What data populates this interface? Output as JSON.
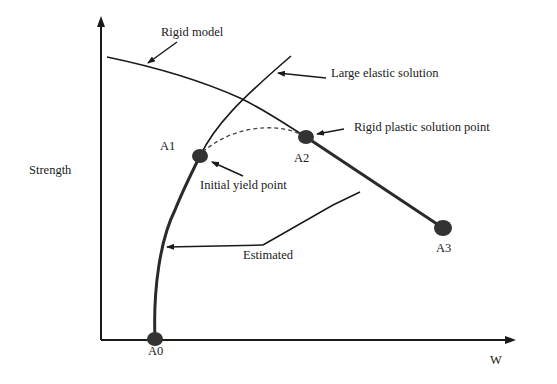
{
  "diagram": {
    "axes": {
      "y_label": "Strength",
      "x_label": "W"
    },
    "curves": {
      "rigid_model": {
        "label": "Rigid model"
      },
      "large_elastic": {
        "label": "Large elastic solution"
      },
      "estimated": {
        "label": "Estimated"
      }
    },
    "points": [
      {
        "id": "A0",
        "label": "A0"
      },
      {
        "id": "A1",
        "label": "A1",
        "annotation": "Initial yield point"
      },
      {
        "id": "A2",
        "label": "A2",
        "annotation": "Rigid plastic solution point"
      },
      {
        "id": "A3",
        "label": "A3"
      }
    ],
    "colors": {
      "line": "#1a1a1a",
      "point": "#333333",
      "background": "#ffffff"
    }
  }
}
